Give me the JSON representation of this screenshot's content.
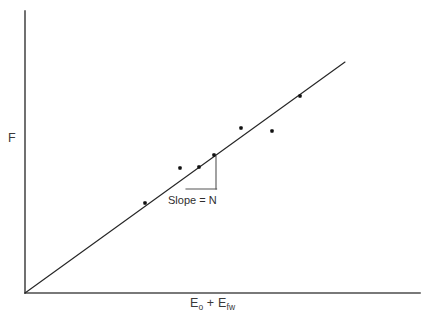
{
  "figure": {
    "background_color": "#ffffff",
    "width": 425,
    "height": 324
  },
  "axes": {
    "y_label": "F",
    "x_label_parts": {
      "first_symbol": "E",
      "first_subscript": "o",
      "operator": " + ",
      "second_symbol": "E",
      "second_subscript": "fw"
    },
    "x_label_plain": "E o + E fw",
    "axis_color": "#4d4d4d",
    "origin_px": {
      "x": 25,
      "y": 293
    },
    "y_axis_top_px": {
      "x": 25,
      "y": 11
    },
    "x_axis_right_px": {
      "x": 420,
      "y": 293
    },
    "ticks": "none",
    "grid": "off"
  },
  "annotation": {
    "slope_label": "Slope = N",
    "slope_label_color": "#2e2e2e",
    "triangle_color": "#555555",
    "triangle_vertices_px": {
      "top_right": {
        "x": 216,
        "y": 156
      },
      "bottom_right": {
        "x": 216,
        "y": 189
      },
      "bottom_left": {
        "x": 186,
        "y": 189
      }
    }
  },
  "chart_data": {
    "type": "scatter",
    "title": "",
    "subtitle": "",
    "xlabel": "E_o + E_fw",
    "ylabel": "F",
    "xlim": [
      0,
      1
    ],
    "ylim": [
      0,
      1
    ],
    "grid": false,
    "legend": "none",
    "axis_ticks": false,
    "point_color": "#111111",
    "point_marker": "square-dot",
    "series": [
      {
        "name": "measurements",
        "x": [
          0.304,
          0.392,
          0.441,
          0.478,
          0.547,
          0.625,
          0.696
        ],
        "y": [
          0.319,
          0.443,
          0.447,
          0.489,
          0.585,
          0.575,
          0.699
        ],
        "pixel_points": [
          {
            "x": 145,
            "y": 203
          },
          {
            "x": 180,
            "y": 168
          },
          {
            "x": 199,
            "y": 167
          },
          {
            "x": 214,
            "y": 155
          },
          {
            "x": 241,
            "y": 128
          },
          {
            "x": 272,
            "y": 131
          },
          {
            "x": 300,
            "y": 96
          }
        ]
      }
    ],
    "fit_line": {
      "name": "linear fit through origin",
      "slope_label": "N",
      "intercept": 0,
      "x": [
        0.0,
        1.0
      ],
      "y": [
        0.0,
        1.0
      ],
      "pixel_start": {
        "x": 25,
        "y": 293
      },
      "pixel_end": {
        "x": 345,
        "y": 62
      },
      "color": "#262626"
    },
    "slope_triangle": {
      "run_px": 30,
      "rise_px": 33,
      "label": "Slope = N"
    }
  }
}
